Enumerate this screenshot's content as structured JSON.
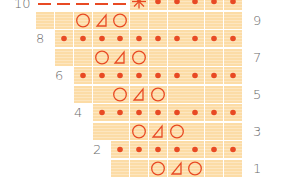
{
  "chart": {
    "colors": {
      "cell": "#fcdca6",
      "symbol": "#e84a24",
      "label": "#6b6b6b",
      "grid": "#ffffff"
    },
    "legend_symbols": {
      "dot": "purl",
      "circle": "yarn over",
      "triangle": "decrease",
      "asterisk": "pattern marker",
      "dash": "no stitch / continuation"
    },
    "columns_x": [
      36,
      55,
      74,
      93,
      111,
      130,
      149,
      168,
      186,
      205,
      224
    ],
    "rows": [
      {
        "number": "10",
        "label_side": "left",
        "y": -7,
        "start_col": 0,
        "cells": [
          "dash",
          "dash",
          "dash",
          "dash",
          "dash",
          "asterisk",
          "dot",
          "dot",
          "dot",
          "dot",
          "dot"
        ],
        "label_x": 18
      },
      {
        "number": "9",
        "label_side": "right",
        "y": 12,
        "start_col": 0,
        "cells": [
          "empty",
          "empty",
          "circle",
          "triangle",
          "circle",
          "empty",
          "empty",
          "empty",
          "empty",
          "empty",
          "empty"
        ],
        "label_x": 253
      },
      {
        "number": "8",
        "label_side": "left",
        "y": 30,
        "start_col": 1,
        "cells": [
          "dot",
          "dot",
          "dot",
          "dot",
          "dot",
          "dot",
          "dot",
          "dot",
          "dot",
          "dot"
        ],
        "label_x": 36
      },
      {
        "number": "7",
        "label_side": "right",
        "y": 49,
        "start_col": 1,
        "cells": [
          "empty",
          "empty",
          "circle",
          "triangle",
          "circle",
          "empty",
          "empty",
          "empty",
          "empty",
          "empty"
        ],
        "label_x": 253
      },
      {
        "number": "6",
        "label_side": "left",
        "y": 67,
        "start_col": 2,
        "cells": [
          "dot",
          "dot",
          "dot",
          "dot",
          "dot",
          "dot",
          "dot",
          "dot",
          "dot"
        ],
        "label_x": 55
      },
      {
        "number": "5",
        "label_side": "right",
        "y": 86,
        "start_col": 2,
        "cells": [
          "empty",
          "empty",
          "circle",
          "triangle",
          "circle",
          "empty",
          "empty",
          "empty",
          "empty"
        ],
        "label_x": 253
      },
      {
        "number": "4",
        "label_side": "left",
        "y": 104,
        "start_col": 3,
        "cells": [
          "dot",
          "dot",
          "dot",
          "dot",
          "dot",
          "dot",
          "dot",
          "dot"
        ],
        "label_x": 74
      },
      {
        "number": "3",
        "label_side": "right",
        "y": 123,
        "start_col": 3,
        "cells": [
          "empty",
          "empty",
          "circle",
          "triangle",
          "circle",
          "empty",
          "empty",
          "empty"
        ],
        "label_x": 253
      },
      {
        "number": "2",
        "label_side": "left",
        "y": 141,
        "start_col": 4,
        "cells": [
          "dot",
          "dot",
          "dot",
          "dot",
          "dot",
          "dot",
          "dot"
        ],
        "label_x": 93
      },
      {
        "number": "1",
        "label_side": "right",
        "y": 160,
        "start_col": 4,
        "cells": [
          "empty",
          "empty",
          "circle",
          "triangle",
          "circle",
          "empty",
          "empty"
        ],
        "label_x": 253
      }
    ]
  }
}
